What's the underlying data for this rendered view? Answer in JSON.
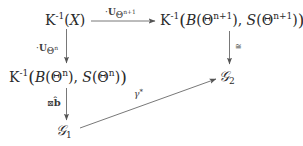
{
  "diagram": {
    "type": "commutative-diagram",
    "nodes": {
      "k_inv_x": {
        "K": "K",
        "sup": "-1",
        "open": "(",
        "var": "X",
        "close": ")"
      },
      "k_inv_b_s_n1": {
        "K": "K",
        "sup": "-1",
        "open": "(",
        "B": "B",
        "theta_open": "(Θ",
        "theta_sup": "n+1",
        "theta_close": ")",
        "comma": ", ",
        "S": "S",
        "theta2_open": "(Θ",
        "theta2_sup": "n+1",
        "theta2_close": ")",
        "close": ")"
      },
      "k_inv_b_s_n": {
        "K": "K",
        "sup": "-1",
        "open": "(",
        "B": "B",
        "theta_open": "(Θ",
        "theta_sup": "n",
        "theta_close": ")",
        "comma": ", ",
        "S": "S",
        "theta2_open": "(Θ",
        "theta2_sup": "n",
        "theta2_close": ")",
        "close": ")"
      },
      "g2": {
        "symbol": "𝒢",
        "sub": "2"
      },
      "g1": {
        "symbol": "𝒢",
        "sub": "1"
      }
    },
    "arrows": {
      "top": {
        "from": "K^-1(X)",
        "to": "K^-1(B(Θ^{n+1}), S(Θ^{n+1}))",
        "label_dot": "·",
        "label_U": "U",
        "label_sub_theta": "Θ",
        "label_sub_sup": "n+1"
      },
      "left_upper": {
        "from": "K^-1(X)",
        "to": "K^-1(B(Θ^n), S(Θ^n))",
        "label_dot": "·",
        "label_U": "U",
        "label_sub_theta": "Θ",
        "label_sub_sup": "n"
      },
      "right": {
        "from": "K^-1(B(Θ^{n+1}), S(Θ^{n+1}))",
        "to": "G_2",
        "label": "≅"
      },
      "left_lower": {
        "from": "K^-1(B(Θ^n), S(Θ^n))",
        "to": "G_1",
        "label_box": "⊠",
        "label_b": "b̂"
      },
      "diagonal": {
        "from": "G_1",
        "to": "G_2",
        "label_gamma": "γ",
        "label_star": "*"
      }
    },
    "colors": {
      "text": "#2a2a2a",
      "arrow": "#555555",
      "background": "#ffffff"
    }
  }
}
